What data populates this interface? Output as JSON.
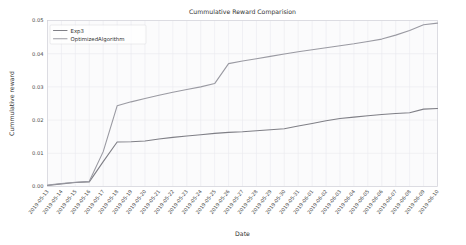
{
  "chart_data": {
    "type": "line",
    "title": "Cummulative Reward Comparision",
    "xlabel": "Date",
    "ylabel": "Cummulative reward",
    "grid": true,
    "legend_position": "upper left",
    "ylim": [
      0.0,
      0.05
    ],
    "yticks": [
      0.0,
      0.01,
      0.02,
      0.03,
      0.04,
      0.05
    ],
    "ytick_labels": [
      "0.00",
      "0.01",
      "0.02",
      "0.03",
      "0.04",
      "0.05"
    ],
    "x": [
      "2019-05-13",
      "2019-05-14",
      "2019-05-15",
      "2019-05-16",
      "2019-05-17",
      "2019-05-18",
      "2019-05-19",
      "2019-05-20",
      "2019-05-21",
      "2019-05-22",
      "2019-05-23",
      "2019-05-24",
      "2019-05-25",
      "2019-05-26",
      "2019-05-27",
      "2019-05-28",
      "2019-05-29",
      "2019-05-30",
      "2019-05-31",
      "2019-06-01",
      "2019-06-02",
      "2019-06-03",
      "2019-06-04",
      "2019-06-05",
      "2019-06-06",
      "2019-06-07",
      "2019-06-08",
      "2019-06-09",
      "2019-06-10"
    ],
    "categories": [
      "2019-05-13",
      "2019-05-14",
      "2019-05-15",
      "2019-05-16",
      "2019-05-17",
      "2019-05-18",
      "2019-05-19",
      "2019-05-20",
      "2019-05-21",
      "2019-05-22",
      "2019-05-23",
      "2019-05-24",
      "2019-05-25",
      "2019-05-26",
      "2019-05-27",
      "2019-05-28",
      "2019-05-29",
      "2019-05-30",
      "2019-05-31",
      "2019-06-01",
      "2019-06-02",
      "2019-06-03",
      "2019-06-04",
      "2019-06-05",
      "2019-06-06",
      "2019-06-07",
      "2019-06-08",
      "2019-06-09",
      "2019-06-10"
    ],
    "series": [
      {
        "name": "Exp3",
        "color": "#7f7f86",
        "width": 1.1,
        "values": [
          0.0003,
          0.0008,
          0.0012,
          0.0014,
          0.0075,
          0.0134,
          0.0135,
          0.0137,
          0.0143,
          0.0148,
          0.0152,
          0.0156,
          0.016,
          0.0163,
          0.0165,
          0.0168,
          0.0171,
          0.0174,
          0.0182,
          0.019,
          0.0198,
          0.0205,
          0.0209,
          0.0213,
          0.0217,
          0.022,
          0.0222,
          0.0233,
          0.0235
        ]
      },
      {
        "name": "OptimizedAlgorithm",
        "color": "#9a9aa2",
        "width": 1.1,
        "values": [
          0.0004,
          0.0009,
          0.0013,
          0.0016,
          0.0105,
          0.0243,
          0.0255,
          0.0265,
          0.0275,
          0.0284,
          0.0292,
          0.03,
          0.031,
          0.037,
          0.0378,
          0.0385,
          0.0392,
          0.0399,
          0.0406,
          0.0412,
          0.0418,
          0.0424,
          0.043,
          0.0437,
          0.0444,
          0.0456,
          0.047,
          0.0487,
          0.0492
        ]
      }
    ]
  },
  "legend": {
    "items": [
      {
        "label": "Exp3"
      },
      {
        "label": "OptimizedAlgorithm"
      }
    ]
  },
  "colors": {
    "series_exp3": "#7f7f86",
    "series_optimized": "#9a9aa2",
    "grid": "#e9e9ee",
    "background": "#ffffff",
    "plot_background": "#fbfbfc",
    "text": "#333333"
  }
}
